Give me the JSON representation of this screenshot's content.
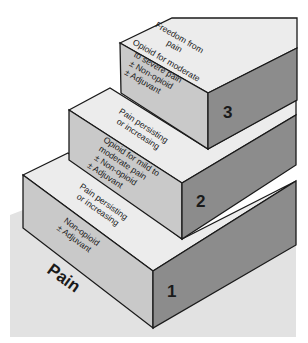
{
  "diagram": {
    "colors": {
      "floor": "#e2e2e2",
      "tread": "#ececec",
      "left_face": "#c9c9c9",
      "right_face": "#8c8c8c",
      "outline": "#1a1a1a"
    },
    "base_label": "Pain",
    "steps": [
      {
        "number": "1",
        "riser_lines": [
          "Non-opioid",
          "± Adjuvant"
        ],
        "tread_lines": [
          "Pain persisting",
          "or increasing"
        ]
      },
      {
        "number": "2",
        "riser_lines": [
          "Opioid for mild to",
          "moderate pain",
          "± Non-opioid",
          "± Adjuvant"
        ],
        "tread_lines": [
          "Pain persisting",
          "or increasing"
        ]
      },
      {
        "number": "3",
        "riser_lines": [
          "Opioid for moderate",
          "to severe pain",
          "± Non-opioid",
          "± Adjuvant"
        ],
        "tread_lines": [
          "Freedom from",
          "pain"
        ]
      }
    ]
  }
}
